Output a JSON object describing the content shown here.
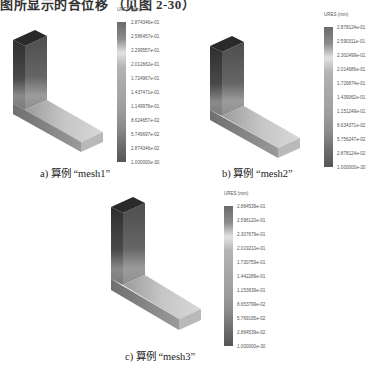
{
  "page": {
    "top_text": "图所显示的合位移 （见图 2-30）"
  },
  "panels": [
    {
      "id": "a",
      "caption": "a) 算例 “mesh1”",
      "legend": {
        "title": "URES (mm)",
        "labels": [
          "2.874346e-01",
          "2.586457e-01",
          "2.299557e-01",
          "2.012662e-01",
          "1.724967e-01",
          "1.437471e-01",
          "1.149978e-01",
          "8.624657e-02",
          "5.749697e-02",
          "2.874346e-02",
          "1.000000e-30"
        ]
      }
    },
    {
      "id": "b",
      "caption": "b) 算例 “mesh2”",
      "legend": {
        "title": "URES (mm)",
        "labels": [
          "2.878124e-01",
          "2.590311e-01",
          "2.302499e-01",
          "2.014686e-01",
          "1.726874e-01",
          "1.439062e-01",
          "1.151249e-01",
          "8.634371e-02",
          "5.756247e-02",
          "2.878124e-02",
          "1.000000e-30"
        ]
      }
    },
    {
      "id": "c",
      "caption": "c) 算例 “mesh3”",
      "legend": {
        "title": "URES (mm)",
        "labels": [
          "2.884539e-01",
          "2.596120e-01",
          "2.307679e-01",
          "2.019210e-01",
          "1.730759e-01",
          "1.442289e-01",
          "1.153839e-01",
          "8.653799e-02",
          "5.769195e-02",
          "2.884539e-02",
          "1.000000e-30"
        ]
      }
    }
  ],
  "colors": {
    "model_dark": "#3a3a3a",
    "model_light": "#c8c8c8",
    "legend_top": "#6a6a6a",
    "legend_bottom": "#555555"
  }
}
